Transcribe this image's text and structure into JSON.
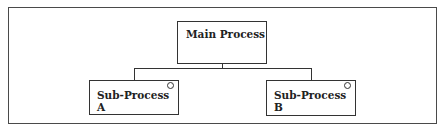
{
  "diagram": {
    "type": "hierarchy",
    "nodes": {
      "main": {
        "label": "Main Process"
      },
      "sub_a": {
        "label_line1": "Sub-Process",
        "label_line2": "A",
        "marker": "circle"
      },
      "sub_b": {
        "label_line1": "Sub-Process",
        "label_line2": "B",
        "marker": "circle"
      }
    },
    "edges": [
      {
        "from": "Main Process",
        "to": "Sub-Process A"
      },
      {
        "from": "Main Process",
        "to": "Sub-Process B"
      }
    ]
  }
}
